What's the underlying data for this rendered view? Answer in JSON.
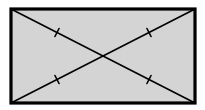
{
  "diagram": {
    "type": "geometry",
    "shape": "rectangle",
    "vertices": [
      "top-left",
      "top-right",
      "bottom-right",
      "bottom-left"
    ],
    "diagonals": [
      {
        "from": "top-left",
        "to": "bottom-right"
      },
      {
        "from": "bottom-left",
        "to": "top-right"
      }
    ],
    "congruence_ticks": {
      "count_per_segment": 1,
      "segments": [
        "top-left to center",
        "center to bottom-right",
        "bottom-left to center",
        "center to top-right"
      ]
    },
    "colors": {
      "fill": "#d4d4d4",
      "stroke": "#000000",
      "background": "#ffffff"
    }
  }
}
